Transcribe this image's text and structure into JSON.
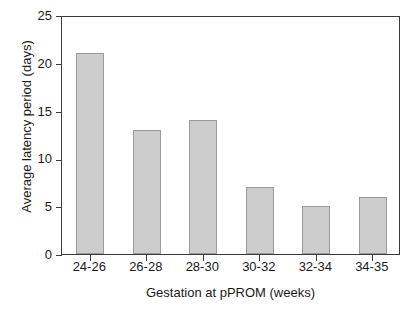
{
  "chart_data": {
    "type": "bar",
    "title": "",
    "xlabel": "Gestation at pPROM (weeks)",
    "ylabel": "Average latency period (days)",
    "categories": [
      "24-26",
      "26-28",
      "28-30",
      "30-32",
      "32-34",
      "34-35"
    ],
    "values": [
      21,
      13,
      14,
      7,
      5,
      6
    ],
    "series": [
      {
        "name": "Average latency period",
        "values": [
          21,
          13,
          14,
          7,
          5,
          6
        ]
      }
    ],
    "ylim": [
      0,
      25
    ],
    "yticks": [
      0,
      5,
      10,
      15,
      20,
      25
    ],
    "ytick_labels": [
      "0",
      "5",
      "10",
      "15",
      "20",
      "25"
    ],
    "grid": false,
    "legend": false,
    "legend_position": "none",
    "bar_fill_color": "#cdcdcd",
    "bar_border_color": "#9a9a9a",
    "axis_color": "#3a3a3a",
    "background_color": "#ffffff",
    "text_color": "#1a1a1a"
  }
}
